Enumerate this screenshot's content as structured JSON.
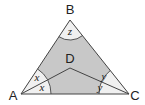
{
  "diagram": {
    "type": "geometry-triangle",
    "colors": {
      "shaded_region": "#c8c8c8",
      "unshaded_sector": "#f0f0f0",
      "lines": "#444444",
      "background": "#ffffff"
    },
    "vertices": {
      "A": {
        "label": "A",
        "x": 21,
        "y": 94
      },
      "B": {
        "label": "B",
        "x": 70,
        "y": 20
      },
      "C": {
        "label": "C",
        "x": 129,
        "y": 94
      },
      "D": {
        "label": "D",
        "x": 70,
        "y": 68
      }
    },
    "angle_labels": {
      "B": "z",
      "A_upper": "x",
      "A_lower": "x",
      "C_upper": "y",
      "C_lower": "y"
    },
    "segments": [
      "AB",
      "BC",
      "CA",
      "AD",
      "DC"
    ]
  }
}
